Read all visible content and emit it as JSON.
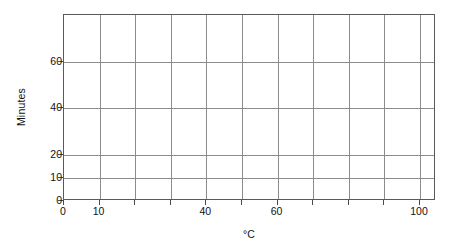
{
  "chart_data": {
    "type": "line",
    "title": "",
    "subtitle": "",
    "xlabel": "°C",
    "ylabel": "Minutes",
    "xlim": [
      0,
      104.5
    ],
    "ylim": [
      0,
      80
    ],
    "grid": true,
    "legend": null,
    "annotations": [],
    "series": [],
    "note": "Blank plotting grid — no data series are drawn.",
    "x_ticks": [
      {
        "value": 0,
        "label": "0"
      },
      {
        "value": 10,
        "label": "10"
      },
      {
        "value": 20,
        "label": ""
      },
      {
        "value": 30,
        "label": ""
      },
      {
        "value": 40,
        "label": "40"
      },
      {
        "value": 50,
        "label": ""
      },
      {
        "value": 60,
        "label": "60"
      },
      {
        "value": 70,
        "label": ""
      },
      {
        "value": 80,
        "label": ""
      },
      {
        "value": 90,
        "label": ""
      },
      {
        "value": 100,
        "label": "100"
      }
    ],
    "y_ticks": [
      {
        "value": 0,
        "label": "0"
      },
      {
        "value": 10,
        "label": "10"
      },
      {
        "value": 20,
        "label": "20"
      },
      {
        "value": 40,
        "label": "40"
      },
      {
        "value": 60,
        "label": "60"
      }
    ],
    "x_gridlines": [
      10,
      20,
      30,
      40,
      50,
      60,
      70,
      80,
      90,
      100
    ],
    "y_gridlines": [
      10,
      20,
      40,
      60
    ],
    "colors": {
      "background": "#ffffff",
      "grid": "#8c8c8c",
      "frame": "#5a5a5a",
      "tick": "#4a4a4a",
      "text": "#111111"
    }
  },
  "axes": {
    "x_title": "°C",
    "y_title": "Minutes"
  }
}
